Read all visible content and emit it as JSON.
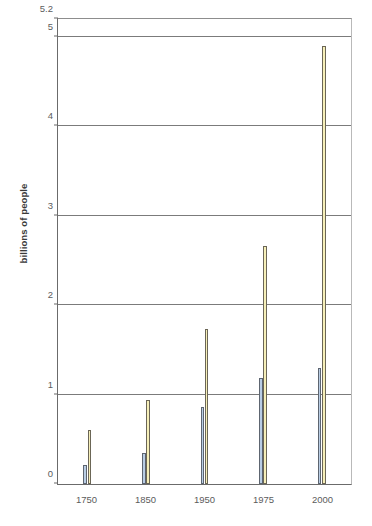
{
  "chart_data": {
    "type": "bar",
    "title": "",
    "xlabel": "",
    "ylabel": "billions of people",
    "categories": [
      "1750",
      "1850",
      "1950",
      "1975",
      "2000"
    ],
    "series": [
      {
        "name": "series-blue",
        "color": "#b9cde4",
        "values": [
          0.21,
          0.35,
          0.86,
          1.19,
          1.3
        ]
      },
      {
        "name": "series-cream",
        "color": "#f6efb9",
        "values": [
          0.6,
          0.94,
          1.73,
          2.66,
          4.9
        ]
      }
    ],
    "ylim": [
      0,
      5.2
    ],
    "yticks": [
      0,
      1,
      2,
      3,
      4,
      5,
      5.2
    ],
    "ytick_labels": [
      "0",
      "1",
      "2",
      "3",
      "4",
      "5",
      "5.2"
    ],
    "gridlines": [
      1,
      2,
      3,
      4,
      5
    ],
    "grid": true,
    "legend": "none"
  },
  "caption": {
    "text": ""
  }
}
